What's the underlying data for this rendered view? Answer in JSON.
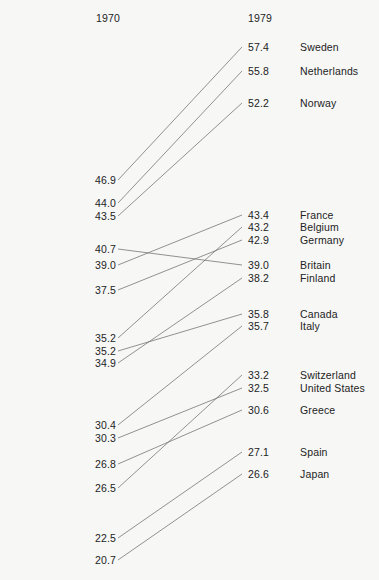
{
  "chart_data": {
    "type": "line",
    "subtype": "slopegraph",
    "title": "",
    "xlabel": "",
    "ylabel": "",
    "categories": [
      "1970",
      "1979"
    ],
    "axis_headers": {
      "left": "1970",
      "right": "1979"
    },
    "value_precision": 1,
    "grid": false,
    "legend": "none",
    "left_sorted_desc": true,
    "right_sorted_desc": true,
    "series": [
      {
        "name": "Sweden",
        "values": [
          46.9,
          57.4
        ]
      },
      {
        "name": "Netherlands",
        "values": [
          44.0,
          55.8
        ]
      },
      {
        "name": "Norway",
        "values": [
          43.5,
          52.2
        ]
      },
      {
        "name": "Britain",
        "values": [
          40.7,
          39.0
        ]
      },
      {
        "name": "France",
        "values": [
          39.0,
          43.4
        ]
      },
      {
        "name": "Germany",
        "values": [
          37.5,
          42.9
        ]
      },
      {
        "name": "Belgium",
        "values": [
          35.2,
          43.2
        ]
      },
      {
        "name": "Canada",
        "values": [
          35.2,
          35.8
        ]
      },
      {
        "name": "Finland",
        "values": [
          34.9,
          38.2
        ]
      },
      {
        "name": "Italy",
        "values": [
          30.4,
          35.7
        ]
      },
      {
        "name": "United States",
        "values": [
          30.3,
          32.5
        ]
      },
      {
        "name": "Greece",
        "values": [
          26.8,
          30.6
        ]
      },
      {
        "name": "Switzerland",
        "values": [
          26.5,
          33.2
        ]
      },
      {
        "name": "Spain",
        "values": [
          22.5,
          27.1
        ]
      },
      {
        "name": "Japan",
        "values": [
          20.7,
          26.6
        ]
      }
    ]
  },
  "left_column": [
    {
      "label": "Sweden",
      "value": "46.9",
      "y": 174
    },
    {
      "label": "Netherlands",
      "value": "44.0",
      "y": 197
    },
    {
      "label": "Norway",
      "value": "43.5",
      "y": 210
    },
    {
      "label": "Britain",
      "value": "40.7",
      "y": 243
    },
    {
      "label": "France",
      "value": "39.0",
      "y": 259
    },
    {
      "label": "Germany",
      "value": "37.5",
      "y": 284
    },
    {
      "label": "Belgium",
      "value": "35.2",
      "y": 332
    },
    {
      "label": "Canada",
      "value": "35.2",
      "y": 345
    },
    {
      "label": "Finland",
      "value": "34.9",
      "y": 357
    },
    {
      "label": "Italy",
      "value": "30.4",
      "y": 419
    },
    {
      "label": "United States",
      "value": "30.3",
      "y": 432
    },
    {
      "label": "Greece",
      "value": "26.8",
      "y": 458
    },
    {
      "label": "Switzerland",
      "value": "26.5",
      "y": 482
    },
    {
      "label": "Spain",
      "value": "22.5",
      "y": 532
    },
    {
      "label": "Japan",
      "value": "20.7",
      "y": 554
    }
  ],
  "right_column": [
    {
      "label": "Sweden",
      "value": "57.4",
      "y": 41
    },
    {
      "label": "Netherlands",
      "value": "55.8",
      "y": 65
    },
    {
      "label": "Norway",
      "value": "52.2",
      "y": 97
    },
    {
      "label": "France",
      "value": "43.4",
      "y": 209
    },
    {
      "label": "Belgium",
      "value": "43.2",
      "y": 221
    },
    {
      "label": "Germany",
      "value": "42.9",
      "y": 234
    },
    {
      "label": "Britain",
      "value": "39.0",
      "y": 259
    },
    {
      "label": "Finland",
      "value": "38.2",
      "y": 272
    },
    {
      "label": "Canada",
      "value": "35.8",
      "y": 308
    },
    {
      "label": "Italy",
      "value": "35.7",
      "y": 320
    },
    {
      "label": "Switzerland",
      "value": "33.2",
      "y": 369
    },
    {
      "label": "United States",
      "value": "32.5",
      "y": 382
    },
    {
      "label": "Greece",
      "value": "30.6",
      "y": 404
    },
    {
      "label": "Spain",
      "value": "27.1",
      "y": 446
    },
    {
      "label": "Japan",
      "value": "26.6",
      "y": 468
    }
  ],
  "geometry": {
    "line_x_start": 118,
    "line_x_end": 242,
    "text_half_height": 6,
    "line_color": "#6f6f6f",
    "text_color": "#232323",
    "background": "#f7f7f6"
  }
}
